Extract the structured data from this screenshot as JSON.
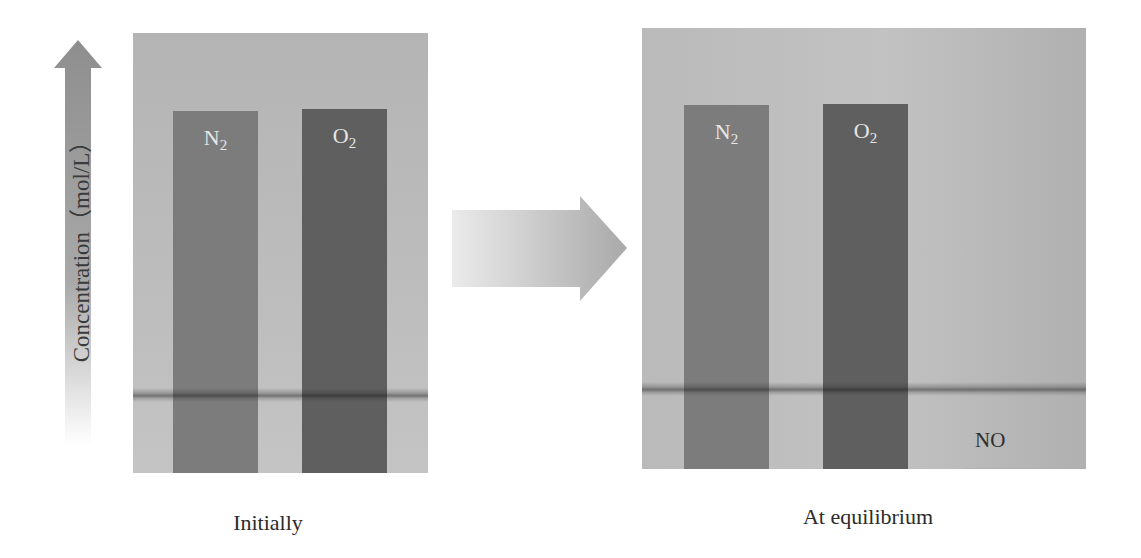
{
  "axis": {
    "label": "Concentration（mol/L）",
    "arrow_icon": "up-arrow-icon"
  },
  "transition_arrow_icon": "right-arrow-icon",
  "panels": [
    {
      "id": "initial",
      "caption": "Initially",
      "bars": [
        {
          "species": "N",
          "subscript": "2",
          "relative_concentration": 1.0,
          "color": "#7c7c7c"
        },
        {
          "species": "O",
          "subscript": "2",
          "relative_concentration": 1.0,
          "color": "#5f5f5f"
        }
      ]
    },
    {
      "id": "equilibrium",
      "caption": "At equilibrium",
      "bars": [
        {
          "species": "N",
          "subscript": "2",
          "relative_concentration": 1.0,
          "color": "#7c7c7c"
        },
        {
          "species": "O",
          "subscript": "2",
          "relative_concentration": 1.0,
          "color": "#5f5f5f"
        },
        {
          "species": "NO",
          "subscript": "",
          "relative_concentration": 0.0,
          "color": "#a8a8a8"
        }
      ]
    }
  ],
  "colors": {
    "panel_background": "#bdbdbd",
    "n2_bar": "#7c7c7c",
    "o2_bar": "#5f5f5f",
    "bar_label_text": "#e6e6e6"
  }
}
